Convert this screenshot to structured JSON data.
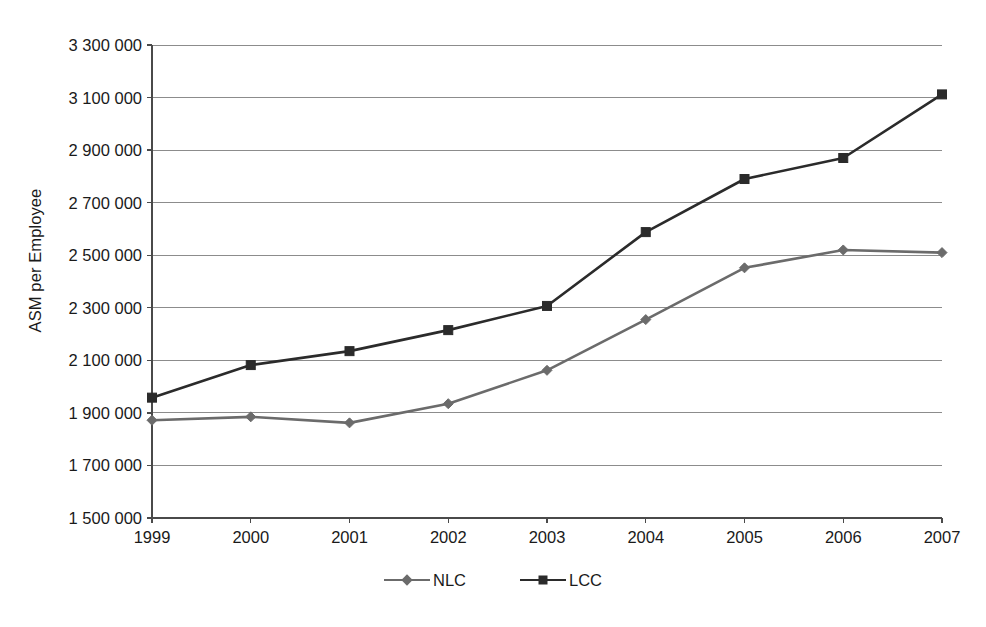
{
  "chart_data": {
    "type": "line",
    "title": "",
    "xlabel": "",
    "ylabel": "ASM per Employee",
    "categories": [
      "1999",
      "2000",
      "2001",
      "2002",
      "2003",
      "2004",
      "2005",
      "2006",
      "2007"
    ],
    "x": [
      1999,
      2000,
      2001,
      2002,
      2003,
      2004,
      2005,
      2006,
      2007
    ],
    "series": [
      {
        "name": "NLC",
        "color": "#6b6b6b",
        "marker": "diamond",
        "values": [
          1872000,
          1885000,
          1862000,
          1935000,
          2062000,
          2255000,
          2452000,
          2520000,
          2510000
        ]
      },
      {
        "name": "LCC",
        "color": "#2b2b2b",
        "marker": "square",
        "values": [
          1958000,
          2082000,
          2135000,
          2215000,
          2307000,
          2588000,
          2790000,
          2870000,
          3112000
        ]
      }
    ],
    "ylim": [
      1500000,
      3300000
    ],
    "ytick_values": [
      1500000,
      1700000,
      1900000,
      2100000,
      2300000,
      2500000,
      2700000,
      2900000,
      3100000,
      3300000
    ],
    "ytick_labels": [
      "1 500 000",
      "1 700 000",
      "1 900 000",
      "2 100 000",
      "2 300 000",
      "2 500 000",
      "2 700 000",
      "2 900 000",
      "3 100 000",
      "3 300 000"
    ],
    "xtick_labels": [
      "1999",
      "2000",
      "2001",
      "2002",
      "2003",
      "2004",
      "2005",
      "2006",
      "2007"
    ],
    "grid": true,
    "grid_axis": "y",
    "legend_position": "bottom",
    "legend_entries": [
      "NLC",
      "LCC"
    ],
    "axis_color": "#4a4a4a",
    "grid_color": "#8c8c8c",
    "background": "#ffffff"
  },
  "legend": {
    "items": [
      {
        "label": "NLC"
      },
      {
        "label": "LCC"
      }
    ]
  }
}
